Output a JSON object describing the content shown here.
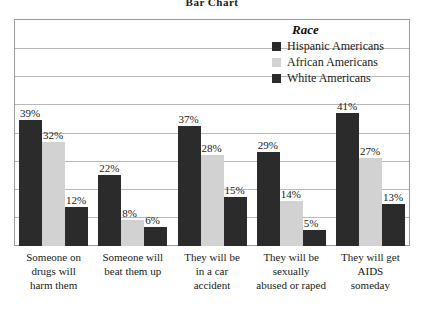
{
  "title": "Bar Chart",
  "legend": {
    "title": "Race",
    "entries": [
      {
        "label": "Hispanic Americans",
        "color": "#2b2b2b",
        "swatch": "dark"
      },
      {
        "label": "African Americans",
        "color": "#d2d2d2",
        "swatch": "light"
      },
      {
        "label": "White Americans",
        "color": "#2b2b2b",
        "swatch": "dark"
      }
    ]
  },
  "chart_data": {
    "type": "bar",
    "title": "Bar Chart",
    "xlabel": "",
    "ylabel": "",
    "ylim": [
      0,
      70
    ],
    "grid": true,
    "legend_position": "top-right",
    "legend_title": "Race",
    "categories": [
      "Someone on drugs will harm them",
      "Someone will beat them up",
      "They will be in a car accident",
      "They will be sexually abused or raped",
      "They will get AIDS someday"
    ],
    "series": [
      {
        "name": "Hispanic Americans",
        "color": "#2b2b2b",
        "values": [
          39,
          22,
          37,
          29,
          41
        ],
        "labels": [
          "39%",
          "22%",
          "37%",
          "29%",
          "41%"
        ]
      },
      {
        "name": "African Americans",
        "color": "#d2d2d2",
        "values": [
          32,
          8,
          28,
          14,
          27
        ],
        "labels": [
          "32%",
          "8%",
          "28%",
          "14%",
          "27%"
        ]
      },
      {
        "name": "White Americans",
        "color": "#2b2b2b",
        "values": [
          12,
          6,
          15,
          5,
          13
        ],
        "labels": [
          "12%",
          "6%",
          "15%",
          "5%",
          "13%"
        ]
      }
    ]
  },
  "category_lines": [
    [
      "Someone on",
      "drugs will",
      "harm them"
    ],
    [
      "Someone will",
      "beat them up"
    ],
    [
      "They will be",
      "in a car",
      "accident"
    ],
    [
      "They will be",
      "sexually",
      "abused or raped"
    ],
    [
      "They will get",
      "AIDS",
      "someday"
    ]
  ]
}
